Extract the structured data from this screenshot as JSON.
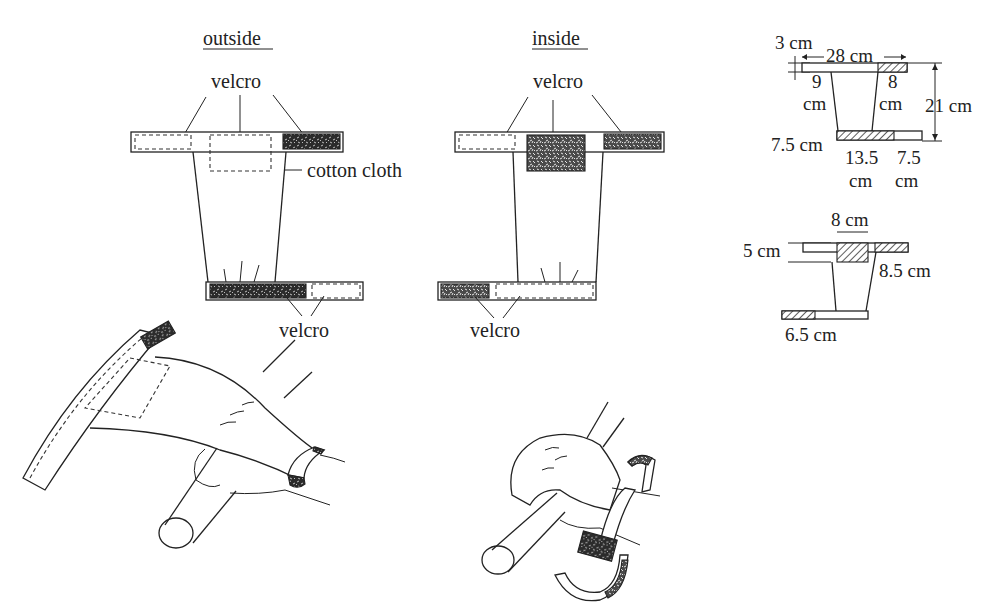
{
  "figure": {
    "panels": {
      "outside": {
        "title": "outside",
        "labels": {
          "velcro_top": "velcro",
          "cotton_cloth": "cotton cloth",
          "velcro_bottom": "velcro"
        }
      },
      "inside": {
        "title": "inside",
        "labels": {
          "velcro_top": "velcro",
          "velcro_bottom": "velcro"
        }
      }
    },
    "dimensions_upper": {
      "strap_width": "3 cm",
      "top_length": "28 cm",
      "top_left_offset": "9",
      "top_left_unit": "cm",
      "top_right_offset": "8",
      "top_right_unit": "cm",
      "height": "21 cm",
      "bottom_strap_width": "7.5 cm",
      "bottom_left_len": "13.5",
      "bottom_left_unit": "cm",
      "bottom_right_len": "7.5",
      "bottom_right_unit": "cm"
    },
    "dimensions_lower": {
      "patch_width": "8 cm",
      "strap_height": "5 cm",
      "right_velcro": "8.5 cm",
      "bottom_velcro": "6.5 cm"
    },
    "illustrations": [
      {
        "name": "glove-open-on-hand",
        "description": "hand gripping bar with glove open"
      },
      {
        "name": "glove-wrapping-bar",
        "description": "hand with glove wrapped around bar, straps opening"
      }
    ]
  }
}
